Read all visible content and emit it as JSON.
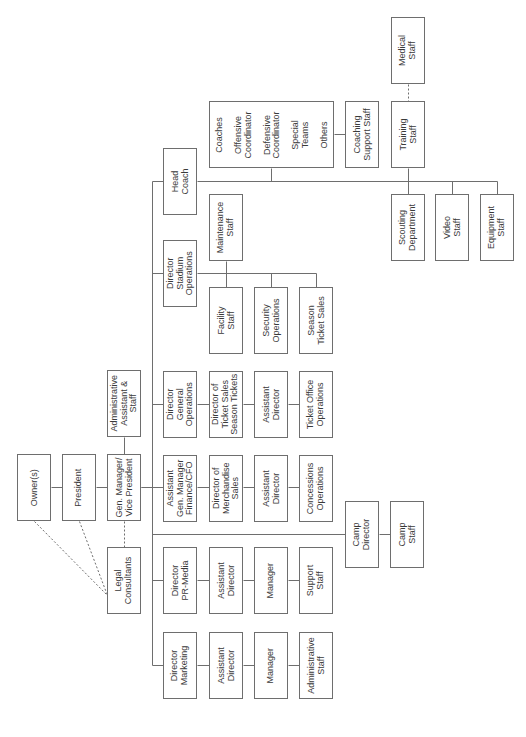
{
  "diagram": {
    "type": "org-chart",
    "orientation": "rotated-90-ccw",
    "colors": {
      "line": "#6e6e6e",
      "text": "#3a3a3a",
      "background": "#ffffff"
    },
    "nodes": [
      {
        "id": "owners",
        "label": "Owner(s)",
        "x": 17,
        "y": 454,
        "w": 34,
        "h": 67
      },
      {
        "id": "president",
        "label": "President",
        "x": 62,
        "y": 454,
        "w": 34,
        "h": 67
      },
      {
        "id": "gm",
        "label": "Gen. Manager/\nVice President",
        "x": 107,
        "y": 454,
        "w": 34,
        "h": 67
      },
      {
        "id": "admin",
        "label": "Administrative\nAssistant &\nStaff",
        "x": 107,
        "y": 370,
        "w": 34,
        "h": 67
      },
      {
        "id": "legal",
        "label": "Legal\nConsultants",
        "x": 107,
        "y": 547,
        "w": 34,
        "h": 67
      },
      {
        "id": "head_coach",
        "label": "Head\nCoach",
        "x": 163,
        "y": 148,
        "w": 34,
        "h": 67
      },
      {
        "id": "coaches",
        "label": "Coaches\n\nOffensive\nCoordinator\n\nDefensive\nCoordinator\n\nSpecial\nTeams\n\nOthers",
        "x": 209,
        "y": 101,
        "w": 125,
        "h": 67
      },
      {
        "id": "coaching_support",
        "label": "Coaching\nSupport Staff",
        "x": 345,
        "y": 101,
        "w": 34,
        "h": 67
      },
      {
        "id": "training",
        "label": "Training\nStaff",
        "x": 391,
        "y": 101,
        "w": 34,
        "h": 67
      },
      {
        "id": "medical",
        "label": "Medical\nStaff",
        "x": 391,
        "y": 17,
        "w": 34,
        "h": 67
      },
      {
        "id": "scouting",
        "label": "Scouting\nDepartment",
        "x": 391,
        "y": 194,
        "w": 34,
        "h": 67
      },
      {
        "id": "video",
        "label": "Video\nStaff",
        "x": 435,
        "y": 194,
        "w": 34,
        "h": 67
      },
      {
        "id": "equipment",
        "label": "Equipment\nStaff",
        "x": 480,
        "y": 194,
        "w": 34,
        "h": 67
      },
      {
        "id": "dir_stadium",
        "label": "Director\nStadium\nOperations",
        "x": 163,
        "y": 240,
        "w": 34,
        "h": 67
      },
      {
        "id": "maintenance",
        "label": "Maintenance\nStaff",
        "x": 209,
        "y": 194,
        "w": 34,
        "h": 67
      },
      {
        "id": "facility",
        "label": "Facility\nStaff",
        "x": 209,
        "y": 287,
        "w": 34,
        "h": 67
      },
      {
        "id": "security",
        "label": "Security\nOperations",
        "x": 254,
        "y": 287,
        "w": 34,
        "h": 67
      },
      {
        "id": "season_ticket_sales",
        "label": "Season\nTicket Sales",
        "x": 299,
        "y": 287,
        "w": 34,
        "h": 67
      },
      {
        "id": "dir_general_ops",
        "label": "Director\nGeneral\nOperations",
        "x": 163,
        "y": 371,
        "w": 34,
        "h": 67
      },
      {
        "id": "dir_ticket_sales",
        "label": "Director of\nTicket Sales\nSeason Tickets",
        "x": 209,
        "y": 371,
        "w": 34,
        "h": 67
      },
      {
        "id": "asst_dir_tickets",
        "label": "Assistant\nDirector",
        "x": 254,
        "y": 371,
        "w": 34,
        "h": 67
      },
      {
        "id": "ticket_office",
        "label": "Ticket Office\nOperations",
        "x": 299,
        "y": 371,
        "w": 34,
        "h": 67
      },
      {
        "id": "asst_gm",
        "label": "Assistant\nGen. Manager\nFinance/CFO",
        "x": 163,
        "y": 455,
        "w": 34,
        "h": 67
      },
      {
        "id": "dir_merch",
        "label": "Director of\nMerchandise\nSales",
        "x": 209,
        "y": 455,
        "w": 34,
        "h": 67
      },
      {
        "id": "asst_dir_merch",
        "label": "Assistant\nDirector",
        "x": 254,
        "y": 455,
        "w": 34,
        "h": 67
      },
      {
        "id": "concessions",
        "label": "Concessions\nOperations",
        "x": 299,
        "y": 455,
        "w": 34,
        "h": 67
      },
      {
        "id": "camp_director",
        "label": "Camp\nDirector",
        "x": 345,
        "y": 501,
        "w": 34,
        "h": 67
      },
      {
        "id": "camp_staff",
        "label": "Camp\nStaff",
        "x": 390,
        "y": 501,
        "w": 34,
        "h": 67
      },
      {
        "id": "dir_pr",
        "label": "Director\nPR-Media",
        "x": 163,
        "y": 547,
        "w": 34,
        "h": 67
      },
      {
        "id": "asst_dir_pr",
        "label": "Assistant\nDirector",
        "x": 209,
        "y": 547,
        "w": 34,
        "h": 67
      },
      {
        "id": "manager_pr",
        "label": "Manager",
        "x": 254,
        "y": 547,
        "w": 34,
        "h": 67
      },
      {
        "id": "support_staff",
        "label": "Support\nStaff",
        "x": 299,
        "y": 547,
        "w": 34,
        "h": 67
      },
      {
        "id": "dir_marketing",
        "label": "Director\nMarketing",
        "x": 163,
        "y": 632,
        "w": 34,
        "h": 67
      },
      {
        "id": "asst_dir_marketing",
        "label": "Assistant\nDirector",
        "x": 209,
        "y": 632,
        "w": 34,
        "h": 67
      },
      {
        "id": "manager_marketing",
        "label": "Manager",
        "x": 254,
        "y": 632,
        "w": 34,
        "h": 67
      },
      {
        "id": "admin_staff_marketing",
        "label": "Administrative\nStaff",
        "x": 299,
        "y": 632,
        "w": 34,
        "h": 67
      }
    ],
    "solid_lines": [
      [
        51,
        487,
        62,
        487
      ],
      [
        96,
        487,
        107,
        487
      ],
      [
        124,
        437,
        124,
        454
      ],
      [
        141,
        487,
        152,
        487
      ],
      [
        152,
        181,
        152,
        665
      ],
      [
        152,
        181,
        163,
        181
      ],
      [
        197,
        181,
        497,
        181
      ],
      [
        271,
        168,
        271,
        181
      ],
      [
        334,
        134,
        345,
        134
      ],
      [
        408,
        168,
        408,
        194
      ],
      [
        452,
        181,
        452,
        194
      ],
      [
        497,
        181,
        497,
        194
      ],
      [
        152,
        273,
        163,
        273
      ],
      [
        197,
        273,
        316,
        273
      ],
      [
        226,
        261,
        226,
        287
      ],
      [
        271,
        273,
        271,
        287
      ],
      [
        316,
        273,
        316,
        287
      ],
      [
        152,
        404,
        163,
        404
      ],
      [
        197,
        404,
        209,
        404
      ],
      [
        243,
        404,
        254,
        404
      ],
      [
        288,
        404,
        299,
        404
      ],
      [
        163,
        487,
        163,
        487
      ],
      [
        141,
        487,
        163,
        487
      ],
      [
        197,
        487,
        209,
        487
      ],
      [
        243,
        487,
        254,
        487
      ],
      [
        288,
        487,
        299,
        487
      ],
      [
        152,
        534,
        345,
        534
      ],
      [
        379,
        534,
        390,
        534
      ],
      [
        152,
        580,
        163,
        580
      ],
      [
        197,
        580,
        209,
        580
      ],
      [
        243,
        580,
        254,
        580
      ],
      [
        288,
        580,
        299,
        580
      ],
      [
        152,
        665,
        163,
        665
      ],
      [
        197,
        665,
        209,
        665
      ],
      [
        243,
        665,
        254,
        665
      ],
      [
        288,
        665,
        299,
        665
      ]
    ],
    "dashed_lines": [
      [
        34,
        521,
        107,
        595
      ],
      [
        79,
        521,
        107,
        595
      ],
      [
        124,
        521,
        124,
        547
      ],
      [
        408,
        84,
        408,
        101
      ]
    ]
  }
}
